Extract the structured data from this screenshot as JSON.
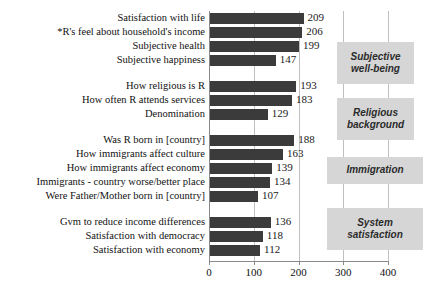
{
  "chart_data": {
    "type": "bar",
    "orientation": "horizontal",
    "title": "",
    "subtitle": "",
    "xlabel": "",
    "ylabel": "",
    "xlim": [
      0,
      400
    ],
    "xticks": [
      0,
      100,
      200,
      300,
      400
    ],
    "xticklabels": [
      "0",
      "100",
      "200",
      "300",
      "400"
    ],
    "grid": true,
    "gridlines_at": [
      100,
      200,
      300,
      400
    ],
    "legend": "none",
    "bar_color": "#3b3b3b",
    "group_box_color": "#d6d6d6",
    "categories": [
      "Satisfaction with life",
      "*R's feel about household's income",
      "Subjective health",
      "Subjective happiness",
      "How religious is R",
      "How often R attends services",
      "Denomination",
      "Was R born in [country]",
      "How immigrants affect culture",
      "How immigrants affect economy",
      "Immigrants - country worse/better place",
      "Were Father/Mother born in [country]",
      "Gvm to reduce income differences",
      "Satisfaction with democracy",
      "Satisfaction with economy"
    ],
    "values": [
      209,
      206,
      199,
      147,
      193,
      183,
      129,
      188,
      163,
      139,
      134,
      107,
      136,
      118,
      112
    ],
    "value_labels": [
      "209",
      "206",
      "199",
      "147",
      "193",
      "183",
      "129",
      "188",
      "163",
      "139",
      "134",
      "107",
      "136",
      "118",
      "112"
    ],
    "groups": [
      {
        "label": "Subjective well-being",
        "label_line1": "Subjective",
        "label_line2": "well-being",
        "indices": [
          0,
          1,
          2,
          3
        ]
      },
      {
        "label": "Religious background",
        "label_line1": "Religious",
        "label_line2": "background",
        "indices": [
          4,
          5,
          6
        ]
      },
      {
        "label": "Immigration",
        "label_line1": "Immigration",
        "label_line2": "",
        "indices": [
          7,
          8,
          9,
          10,
          11
        ]
      },
      {
        "label": "System satisfaction",
        "label_line1": "System",
        "label_line2": "satisfaction",
        "indices": [
          12,
          13,
          14
        ]
      }
    ]
  }
}
